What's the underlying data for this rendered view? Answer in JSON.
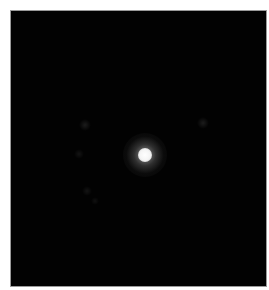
{
  "image": {
    "description": "Dark field with single bright central point source and faint secondary speckles",
    "background_color": "#020202",
    "border_color": "#9a9a9a",
    "frame": {
      "left": 10,
      "top": 10,
      "width": 257,
      "height": 277
    }
  },
  "central_peak": {
    "x": 134,
    "y": 144,
    "core_diameter": 14,
    "halo_diameter": 44,
    "core_color": "#ffffff",
    "halo_color": "rgba(200,200,200,0.22)"
  },
  "faint_spots": [
    {
      "x": 74,
      "y": 114,
      "d": 6,
      "opacity": 0.1
    },
    {
      "x": 192,
      "y": 112,
      "d": 6,
      "opacity": 0.1
    },
    {
      "x": 68,
      "y": 143,
      "d": 5,
      "opacity": 0.07
    },
    {
      "x": 76,
      "y": 180,
      "d": 5,
      "opacity": 0.07
    },
    {
      "x": 84,
      "y": 190,
      "d": 4,
      "opacity": 0.06
    }
  ]
}
